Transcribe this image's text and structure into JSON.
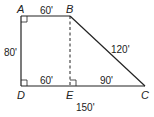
{
  "diagram": {
    "type": "trapezoid",
    "points": {
      "A": {
        "label": "A",
        "x": 21,
        "y": 16
      },
      "B": {
        "label": "B",
        "x": 70,
        "y": 16
      },
      "C": {
        "label": "C",
        "x": 145,
        "y": 86
      },
      "D": {
        "label": "D",
        "x": 21,
        "y": 86
      },
      "E": {
        "label": "E",
        "x": 70,
        "y": 86
      }
    },
    "measurements": {
      "AB": "60'",
      "AD": "80'",
      "BC": "120'",
      "DE": "60'",
      "EC": "90'",
      "DC": "150'"
    },
    "right_angles": [
      "A",
      "D",
      "E"
    ],
    "dashed_segment": "BE"
  }
}
